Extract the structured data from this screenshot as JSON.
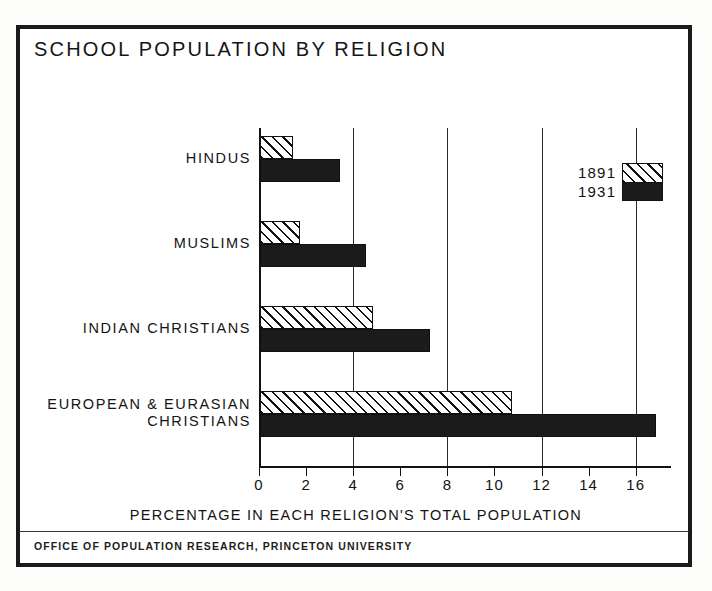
{
  "figure": {
    "title": "SCHOOL POPULATION BY RELIGION",
    "footer": "OFFICE OF POPULATION RESEARCH, PRINCETON UNIVERSITY",
    "xlabel": "PERCENTAGE IN EACH RELIGION'S TOTAL POPULATION"
  },
  "legend": {
    "series_1_label": "1891",
    "series_2_label": "1931"
  },
  "colors": {
    "ink": "#111111",
    "paper": "#ffffff",
    "series_1931_fill": "#1b1b1b"
  },
  "chart_data": {
    "type": "bar",
    "orientation": "horizontal",
    "title": "SCHOOL POPULATION BY RELIGION",
    "xlabel": "PERCENTAGE IN EACH RELIGION'S TOTAL POPULATION",
    "ylabel": "",
    "categories": [
      "HINDUS",
      "MUSLIMS",
      "INDIAN CHRISTIANS",
      "EUROPEAN & EURASIAN\nCHRISTIANS"
    ],
    "series": [
      {
        "name": "1891",
        "values": [
          1.4,
          1.7,
          4.8,
          10.7
        ],
        "style": "hatched"
      },
      {
        "name": "1931",
        "values": [
          3.4,
          4.5,
          7.2,
          16.8
        ],
        "style": "solid-black"
      }
    ],
    "xlim": [
      0,
      17.5
    ],
    "xticks": [
      0,
      2,
      4,
      6,
      8,
      10,
      12,
      14,
      16
    ],
    "xticklabels": [
      "0",
      "2",
      "4",
      "6",
      "8",
      "10",
      "12",
      "14",
      "16"
    ],
    "gridlines_at": [
      0,
      4,
      8,
      12,
      16
    ],
    "grid": true,
    "legend_position": "upper-right",
    "source": "OFFICE OF POPULATION RESEARCH, PRINCETON UNIVERSITY"
  }
}
